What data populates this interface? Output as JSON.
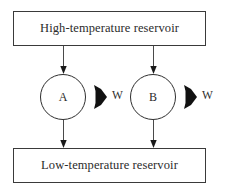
{
  "diagram": {
    "hot_reservoir": {
      "label": "High-temperature reservoir"
    },
    "cold_reservoir": {
      "label": "Low-temperature reservoir"
    },
    "engines": [
      {
        "id": "A",
        "label": "A",
        "work_label": "W"
      },
      {
        "id": "B",
        "label": "B",
        "work_label": "W"
      }
    ],
    "colors": {
      "background": "#ffffff",
      "box_border": "#3a3a3a",
      "circle_border": "#2e2e2e",
      "text": "#2b2b2b",
      "arrow_thin": "#4a4a4a",
      "arrow_solid": "#111111"
    },
    "icons": {
      "heat_in_arrow": "down-arrow-icon",
      "heat_out_arrow": "down-arrow-icon",
      "work_arrow": "thick-right-arrow-icon"
    }
  }
}
